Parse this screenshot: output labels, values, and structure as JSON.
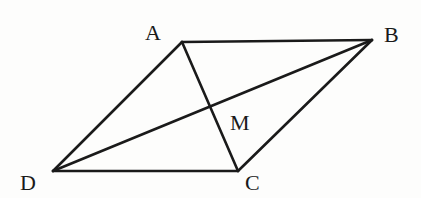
{
  "diagram": {
    "type": "quadrilateral-with-diagonals",
    "stroke_color": "#1a1a1a",
    "background": "#fdfdfc",
    "points": {
      "A": {
        "x": 182,
        "y": 42
      },
      "B": {
        "x": 372,
        "y": 40
      },
      "C": {
        "x": 238,
        "y": 171
      },
      "D": {
        "x": 53,
        "y": 171
      },
      "M": {
        "x": 210,
        "y": 107
      }
    },
    "labels": {
      "A": {
        "text": "A",
        "x": 145,
        "y": 40
      },
      "B": {
        "text": "B",
        "x": 384,
        "y": 42
      },
      "C": {
        "text": "C",
        "x": 245,
        "y": 190
      },
      "D": {
        "text": "D",
        "x": 20,
        "y": 190
      },
      "M": {
        "text": "M",
        "x": 230,
        "y": 130
      }
    },
    "edges": [
      {
        "from": "A",
        "to": "B"
      },
      {
        "from": "B",
        "to": "C"
      },
      {
        "from": "C",
        "to": "D"
      },
      {
        "from": "D",
        "to": "A"
      },
      {
        "from": "A",
        "to": "C"
      },
      {
        "from": "D",
        "to": "B"
      }
    ]
  }
}
